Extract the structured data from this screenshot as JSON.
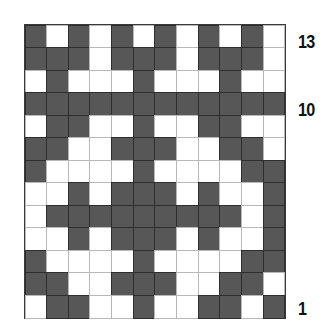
{
  "chart": {
    "columns": 12,
    "rows": 13,
    "colors": {
      "dark": "#575757",
      "light": "#ffffff"
    },
    "row_labels": [
      {
        "row": 13,
        "text": "13"
      },
      {
        "row": 10,
        "text": "10"
      },
      {
        "row": 1,
        "text": "1"
      }
    ],
    "grid_top_to_bottom": [
      {
        "row": 13,
        "cells": "DWDWDWDWDWDW"
      },
      {
        "row": 12,
        "cells": "DDDWDDDWDDDW"
      },
      {
        "row": 11,
        "cells": "WDWWWDWWWDWW"
      },
      {
        "row": 10,
        "cells": "DDDDDDDDDDDD"
      },
      {
        "row": 9,
        "cells": "WDDWWDWWDDWW"
      },
      {
        "row": 8,
        "cells": "DDWWDDDWWDDW"
      },
      {
        "row": 7,
        "cells": "DWWWWDWWWWDD"
      },
      {
        "row": 6,
        "cells": "WWDWDDDWDWWD"
      },
      {
        "row": 5,
        "cells": "WDDDDDDDDDWD"
      },
      {
        "row": 4,
        "cells": "WWDWDDDWDWWD"
      },
      {
        "row": 3,
        "cells": "DWWWWDWWWWDD"
      },
      {
        "row": 2,
        "cells": "DDWWDDDWWDDW"
      },
      {
        "row": 1,
        "cells": "WDDWWDWWDDWD"
      }
    ]
  }
}
